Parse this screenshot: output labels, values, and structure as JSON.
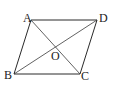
{
  "figure": {
    "colors": {
      "background": "#ffffff",
      "line": "#2a2a2a",
      "label": "#1a1a1a"
    },
    "points": {
      "A": {
        "label": "A",
        "x": 31,
        "y": 20
      },
      "B": {
        "label": "B",
        "x": 14,
        "y": 74
      },
      "C": {
        "label": "C",
        "x": 80,
        "y": 74
      },
      "D": {
        "label": "D",
        "x": 97,
        "y": 20
      },
      "O": {
        "label": "O",
        "x": 55.5,
        "y": 47
      }
    },
    "edges": [
      "AB",
      "BC",
      "CD",
      "DA"
    ],
    "diagonals": [
      "AC",
      "BD"
    ],
    "labels": [
      {
        "text": "A",
        "x": 23,
        "y": 22
      },
      {
        "text": "D",
        "x": 99,
        "y": 22
      },
      {
        "text": "B",
        "x": 4,
        "y": 79
      },
      {
        "text": "C",
        "x": 81,
        "y": 80
      },
      {
        "text": "O",
        "x": 51,
        "y": 60
      }
    ]
  }
}
